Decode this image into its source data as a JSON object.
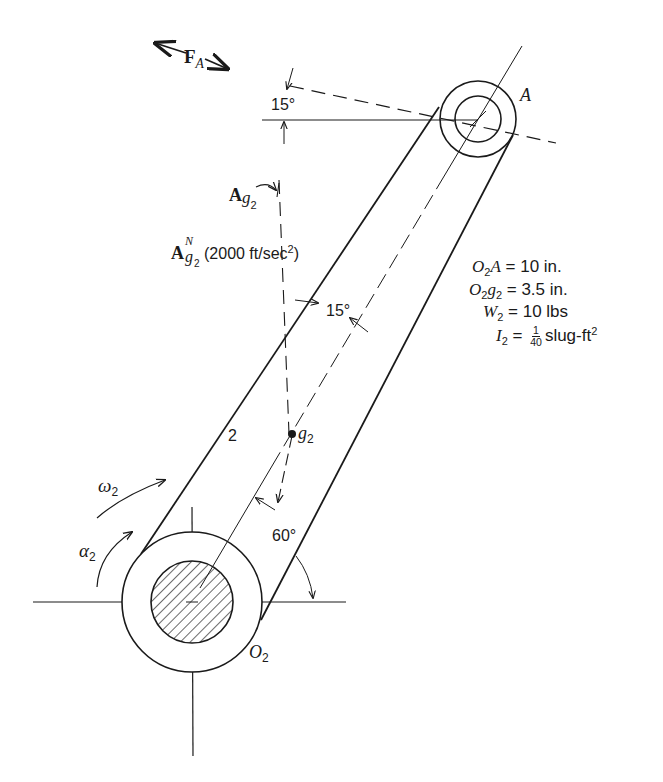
{
  "figure": {
    "link_number": "2",
    "points": {
      "pivot": {
        "label": "O",
        "sub": "2"
      },
      "end": {
        "label": "A"
      },
      "center_of_gravity": {
        "label": "g",
        "sub": "2"
      }
    },
    "force": {
      "label": "F",
      "sub": "A"
    },
    "accelerations": {
      "total": {
        "label": "A",
        "sub": "g",
        "subsub": "2"
      },
      "normal": {
        "label": "A",
        "sup": "N",
        "sub": "g",
        "subsub": "2",
        "value_text": "(2000 ft/sec",
        "value_exp": "2",
        "value_close": ")"
      }
    },
    "angles": {
      "force_angle": "15°",
      "accel_angle": "15°",
      "link_angle": "60°"
    },
    "motion": {
      "omega": {
        "label": "ω",
        "sub": "2"
      },
      "alpha": {
        "label": "α",
        "sub": "2"
      }
    },
    "given": [
      {
        "lhs": "O",
        "lhs_sub": "2",
        "lhs_rest": "A",
        "eq": " = ",
        "value": "10 in."
      },
      {
        "lhs": "O",
        "lhs_sub": "2",
        "lhs_rest": "g",
        "lhs_rest_sub": "2",
        "eq": " = ",
        "value": "3.5 in."
      },
      {
        "lhs": "W",
        "lhs_sub": "2",
        "eq": " = ",
        "value": "10 lbs"
      },
      {
        "lhs": "I",
        "lhs_sub": "2",
        "eq": " = ",
        "frac_num": "1",
        "frac_den": "40",
        "value": "slug-ft",
        "value_exp": "2"
      }
    ],
    "colors": {
      "ink": "#1a1a1a",
      "paper": "#ffffff"
    }
  }
}
